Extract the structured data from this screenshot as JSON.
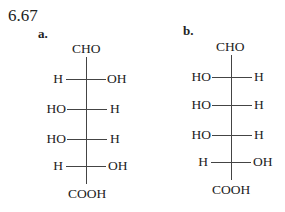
{
  "problem_number": "6.67",
  "structures": [
    {
      "label": "a.",
      "top": "CHO",
      "bottom": "COOH",
      "rows": [
        {
          "left": "H",
          "right": "OH"
        },
        {
          "left": "HO",
          "right": "H"
        },
        {
          "left": "HO",
          "right": "H"
        },
        {
          "left": "H",
          "right": "OH"
        }
      ]
    },
    {
      "label": "b.",
      "top": "CHO",
      "bottom": "COOH",
      "rows": [
        {
          "left": "HO",
          "right": "H"
        },
        {
          "left": "HO",
          "right": "H"
        },
        {
          "left": "HO",
          "right": "H"
        },
        {
          "left": "H",
          "right": "OH"
        }
      ]
    }
  ]
}
